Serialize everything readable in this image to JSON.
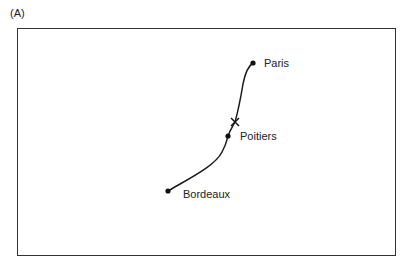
{
  "panel": {
    "label": "(A)"
  },
  "route": {
    "description": "Curved route from Bordeaux through Poitiers to Paris",
    "stroke_color": "#1a1a1a"
  },
  "cities": [
    {
      "name": "Paris",
      "x": 253,
      "y": 63,
      "label_x": 264,
      "label_y": 58
    },
    {
      "name": "Poitiers",
      "x": 228,
      "y": 136,
      "label_x": 240,
      "label_y": 131
    },
    {
      "name": "Bordeaux",
      "x": 168,
      "y": 191,
      "label_x": 183,
      "label_y": 189
    }
  ],
  "marker": {
    "type": "cross",
    "x": 235,
    "y": 122
  }
}
